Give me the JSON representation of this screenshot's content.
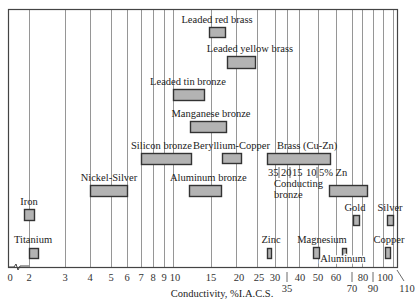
{
  "chart_data": {
    "type": "bar",
    "subtype": "floating-range-bar",
    "title": "",
    "xlabel": "Conductivity, %I.A.C.S.",
    "ylabel": "",
    "xscale": "logarithmic (broken axis between 0 and 2)",
    "xlim": [
      0,
      110
    ],
    "grid": true,
    "colors": {
      "bar_fill": "#b3b3b3",
      "bar_stroke": "#333333",
      "grid": "#8a8a8a",
      "frame": "#444444"
    },
    "x_ticks": [
      {
        "label": "0",
        "value": 0,
        "px": 10,
        "row": 0
      },
      {
        "label": "2",
        "value": 2,
        "px": 29,
        "row": 0
      },
      {
        "label": "3",
        "value": 3,
        "px": 65,
        "row": 0
      },
      {
        "label": "4",
        "value": 4,
        "px": 90,
        "row": 0
      },
      {
        "label": "5",
        "value": 5,
        "px": 111,
        "row": 0
      },
      {
        "label": "6",
        "value": 6,
        "px": 127,
        "row": 0
      },
      {
        "label": "7",
        "value": 7,
        "px": 141,
        "row": 0
      },
      {
        "label": "8",
        "value": 8,
        "px": 153,
        "row": 0
      },
      {
        "label": "9",
        "value": 9,
        "px": 164,
        "row": 0
      },
      {
        "label": "10",
        "value": 10,
        "px": 175,
        "row": 0
      },
      {
        "label": "15",
        "value": 15,
        "px": 211,
        "row": 0
      },
      {
        "label": "20",
        "value": 20,
        "px": 239,
        "row": 0
      },
      {
        "label": "25",
        "value": 25,
        "px": 259,
        "row": 0
      },
      {
        "label": "30",
        "value": 30,
        "px": 275,
        "row": 0
      },
      {
        "label": "35",
        "value": 35,
        "px": 287,
        "row": 1
      },
      {
        "label": "40",
        "value": 40,
        "px": 300,
        "row": 0
      },
      {
        "label": "50",
        "value": 50,
        "px": 318,
        "row": 0
      },
      {
        "label": "60",
        "value": 60,
        "px": 336,
        "row": 0
      },
      {
        "label": "70",
        "value": 70,
        "px": 352,
        "row": 1
      },
      {
        "label": "80",
        "value": 80,
        "px": 363,
        "row": 0
      },
      {
        "label": "90",
        "value": 90,
        "px": 373,
        "row": 1
      },
      {
        "label": "100",
        "value": 100,
        "px": 385,
        "row": 0
      },
      {
        "label": "110",
        "value": 110,
        "px": 407,
        "row": 1
      }
    ],
    "gridlines_px": [
      29,
      65,
      90,
      111,
      127,
      141,
      153,
      164,
      173,
      211,
      236,
      257,
      275,
      287,
      299,
      318,
      336,
      352,
      362,
      373,
      383,
      393
    ],
    "series": [
      {
        "name": "Leaded red brass",
        "min": 15,
        "max": 17,
        "bar": {
          "x1": 209,
          "x2": 225,
          "y": 27,
          "h": 10
        },
        "label_pos": {
          "x": 217,
          "y": 23,
          "anchor": "middle"
        }
      },
      {
        "name": "Leaded yellow brass",
        "min": 18,
        "max": 25,
        "bar": {
          "x1": 227,
          "x2": 255,
          "y": 56,
          "h": 12
        },
        "label_pos": {
          "x": 250,
          "y": 52,
          "anchor": "middle"
        }
      },
      {
        "name": "Leaded tin bronze",
        "min": 10,
        "max": 14,
        "bar": {
          "x1": 173,
          "x2": 204,
          "y": 89,
          "h": 11
        },
        "label_pos": {
          "x": 188,
          "y": 85,
          "anchor": "middle"
        }
      },
      {
        "name": "Manganese bronze",
        "min": 12,
        "max": 17,
        "bar": {
          "x1": 190,
          "x2": 226,
          "y": 121,
          "h": 11
        },
        "label_pos": {
          "x": 211,
          "y": 117,
          "anchor": "middle"
        }
      },
      {
        "name": "Silicon bronze",
        "min": 7,
        "max": 12,
        "bar": {
          "x1": 141,
          "x2": 191,
          "y": 153,
          "h": 11
        },
        "label_pos": {
          "x": 131,
          "y": 149,
          "anchor": "start"
        }
      },
      {
        "name": "Beryllium-Copper",
        "min": 17,
        "max": 21,
        "bar": {
          "x1": 222,
          "x2": 241,
          "y": 153,
          "h": 10
        },
        "label_pos": {
          "x": 193,
          "y": 149,
          "anchor": "start"
        }
      },
      {
        "name": "Brass (Cu-Zn)",
        "min": 27,
        "max": 56,
        "bar": {
          "x1": 267,
          "x2": 330,
          "y": 153,
          "h": 11
        },
        "label_pos": {
          "x": 277,
          "y": 149,
          "anchor": "start"
        },
        "sublabels": [
          "35",
          "20",
          "15",
          "10",
          "5% Zn"
        ]
      },
      {
        "name": "Nickel-Silver",
        "min": 4,
        "max": 6,
        "bar": {
          "x1": 90,
          "x2": 127,
          "y": 185,
          "h": 11
        },
        "label_pos": {
          "x": 109,
          "y": 181,
          "anchor": "middle"
        }
      },
      {
        "name": "Aluminum bronze",
        "min": 12,
        "max": 17,
        "bar": {
          "x1": 189,
          "x2": 221,
          "y": 185,
          "h": 11
        },
        "label_pos": {
          "x": 170,
          "y": 181,
          "anchor": "start"
        }
      },
      {
        "name": "Conducting bronze",
        "min": 55,
        "max": 85,
        "bar": {
          "x1": 329,
          "x2": 367,
          "y": 185,
          "h": 11
        },
        "label_pos": {
          "x": 274,
          "y": 187,
          "anchor": "start"
        }
      },
      {
        "name": "Iron",
        "min": 1.9,
        "max": 2.2,
        "bar": {
          "x1": 24,
          "x2": 34,
          "y": 209,
          "h": 11
        },
        "label_pos": {
          "x": 29,
          "y": 205,
          "anchor": "middle"
        }
      },
      {
        "name": "Gold",
        "min": 72,
        "max": 76,
        "bar": {
          "x1": 353,
          "x2": 359,
          "y": 215,
          "h": 10
        },
        "label_pos": {
          "x": 355,
          "y": 211,
          "anchor": "middle"
        }
      },
      {
        "name": "Silver",
        "min": 104,
        "max": 106,
        "bar": {
          "x1": 387,
          "x2": 393,
          "y": 215,
          "h": 10
        },
        "label_pos": {
          "x": 390,
          "y": 211,
          "anchor": "middle"
        }
      },
      {
        "name": "Titanium",
        "min": 2.1,
        "max": 2.4,
        "bar": {
          "x1": 29,
          "x2": 38,
          "y": 248,
          "h": 10
        },
        "label_pos": {
          "x": 33,
          "y": 243,
          "anchor": "middle"
        }
      },
      {
        "name": "Zinc",
        "min": 27,
        "max": 28,
        "bar": {
          "x1": 267,
          "x2": 271,
          "y": 248,
          "h": 10
        },
        "label_pos": {
          "x": 271,
          "y": 243,
          "anchor": "middle"
        }
      },
      {
        "name": "Magnesium",
        "min": 46,
        "max": 48,
        "bar": {
          "x1": 313,
          "x2": 319,
          "y": 247,
          "h": 11
        },
        "label_pos": {
          "x": 322,
          "y": 243,
          "anchor": "middle"
        }
      },
      {
        "name": "Aluminum",
        "min": 61,
        "max": 64,
        "bar": {
          "x1": 342,
          "x2": 346,
          "y": 248,
          "h": 10
        },
        "label_pos": {
          "x": 343,
          "y": 262,
          "anchor": "middle"
        }
      },
      {
        "name": "Copper",
        "min": 100,
        "max": 103,
        "bar": {
          "x1": 385,
          "x2": 390,
          "y": 247,
          "h": 11
        },
        "label_pos": {
          "x": 389,
          "y": 243,
          "anchor": "middle"
        }
      }
    ]
  }
}
